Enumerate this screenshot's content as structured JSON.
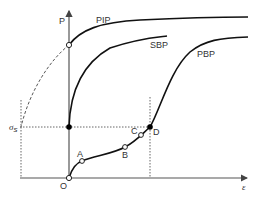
{
  "diagram": {
    "axes": {
      "y_label": "P",
      "x_label": "ε",
      "origin_label": "O",
      "stress_label": "σ",
      "stress_subscript": "s"
    },
    "curves": {
      "pip": "PIP",
      "sbp": "SBP",
      "pbp": "PBP"
    },
    "points": {
      "a": "A",
      "b": "B",
      "c": "C",
      "d": "D"
    },
    "colors": {
      "curve": "#111111",
      "axis": "#444444",
      "guide": "#555555"
    }
  }
}
